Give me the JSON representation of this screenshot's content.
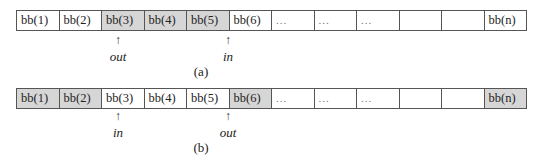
{
  "diagram_a": {
    "cells": [
      {
        "label": "bb(1)",
        "shaded": false
      },
      {
        "label": "bb(2)",
        "shaded": false
      },
      {
        "label": "bb(3)",
        "shaded": true
      },
      {
        "label": "bb(4)",
        "shaded": true
      },
      {
        "label": "bb(5)",
        "shaded": true
      },
      {
        "label": "bb(6)",
        "shaded": false
      },
      {
        "label": "...",
        "shaded": false
      },
      {
        "label": "...",
        "shaded": false
      },
      {
        "label": "...",
        "shaded": false
      },
      {
        "label": "",
        "shaded": false
      },
      {
        "label": "",
        "shaded": false
      },
      {
        "label": "bb(n)",
        "shaded": false
      }
    ],
    "pointer_out": {
      "arrow": "↑",
      "label": "out"
    },
    "pointer_in": {
      "arrow": "↑",
      "label": "in"
    },
    "caption": "(a)"
  },
  "diagram_b": {
    "cells": [
      {
        "label": "bb(1)",
        "shaded": true
      },
      {
        "label": "bb(2)",
        "shaded": true
      },
      {
        "label": "bb(3)",
        "shaded": false
      },
      {
        "label": "bb(4)",
        "shaded": false
      },
      {
        "label": "bb(5)",
        "shaded": false
      },
      {
        "label": "bb(6)",
        "shaded": true
      },
      {
        "label": "...",
        "shaded": false
      },
      {
        "label": "...",
        "shaded": false
      },
      {
        "label": "...",
        "shaded": false
      },
      {
        "label": "",
        "shaded": false
      },
      {
        "label": "",
        "shaded": false
      },
      {
        "label": "bb(n)",
        "shaded": true
      }
    ],
    "pointer_in": {
      "arrow": "↑",
      "label": "in"
    },
    "pointer_out": {
      "arrow": "↑",
      "label": "out"
    },
    "caption": "(b)"
  },
  "colors": {
    "shaded": "#d6d6d6",
    "border": "#555555"
  }
}
